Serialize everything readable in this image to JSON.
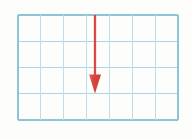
{
  "figure": {
    "name": "grid-with-downward-arrow",
    "canvas": {
      "width": 193,
      "height": 138,
      "background_color": "#fdfdfc"
    },
    "grid": {
      "name": "blue-grid",
      "columns": 7,
      "rows": 4,
      "x_start": 18,
      "y_start": 15,
      "x_end": 178,
      "y_end": 120,
      "cell_width": 22.86,
      "cell_height": 26.25,
      "line_color": "#a9d6e5",
      "line_color_dark": "#8fc4d6",
      "line_width": 1.1,
      "x_positions": [
        18,
        40.9,
        63.7,
        86.6,
        109.4,
        132.3,
        155.1,
        178
      ],
      "y_positions": [
        15,
        41.25,
        67.5,
        93.75,
        120
      ]
    },
    "arrow": {
      "name": "red-down-arrow",
      "direction": "down",
      "color": "#d8453e",
      "shaft_color": "#dc5a52",
      "shaft_highlight": "#f0a9a2",
      "x": 95.0,
      "y_tail": 15,
      "y_tip": 93.5,
      "length": 78.5,
      "shaft_width": 2.6,
      "head_width": 12,
      "head_height": 19,
      "head_left_x": 89,
      "head_right_x": 101,
      "head_top_y": 74.5
    }
  }
}
